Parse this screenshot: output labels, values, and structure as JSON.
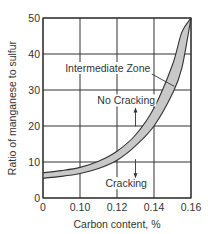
{
  "chart_data": {
    "type": "area",
    "title": "",
    "xlabel": "Carbon content, %",
    "ylabel": "Ratio of manganese to sulfur",
    "x_tick_labels": [
      "0",
      "0.10",
      "0.12",
      "0.14",
      "0.16"
    ],
    "x_tick_values": [
      0.08,
      0.1,
      0.12,
      0.14,
      0.16
    ],
    "y_tick_labels": [
      "0",
      "10",
      "20",
      "30",
      "40",
      "50"
    ],
    "y_tick_values": [
      0,
      10,
      20,
      30,
      40,
      50
    ],
    "xlim": [
      0.08,
      0.16
    ],
    "ylim": [
      0,
      50
    ],
    "grid": true,
    "x_axis_break_note": "first tick labeled 0; axis effectively starts at 0.08",
    "series": [
      {
        "name": "Upper boundary (No Cracking above)",
        "x": [
          0.08,
          0.09,
          0.1,
          0.11,
          0.12,
          0.13,
          0.14,
          0.15,
          0.155,
          0.16
        ],
        "y": [
          7,
          7.6,
          8.5,
          10.2,
          13,
          17.5,
          25,
          37,
          46,
          50
        ]
      },
      {
        "name": "Lower boundary (Cracking below)",
        "x": [
          0.08,
          0.09,
          0.1,
          0.11,
          0.12,
          0.13,
          0.14,
          0.15,
          0.155,
          0.16
        ],
        "y": [
          5.5,
          6,
          6.8,
          8.2,
          10.5,
          14.5,
          20,
          29,
          36,
          50
        ]
      }
    ],
    "annotations": [
      {
        "text": "Intermediate Zone",
        "x": 0.115,
        "y": 35,
        "leader_to": {
          "x": 0.151,
          "y": 31
        }
      },
      {
        "text": "No Cracking",
        "x": 0.125,
        "y": 26,
        "arrow": "up",
        "arrow_x": 0.13
      },
      {
        "text": "Cracking",
        "x": 0.125,
        "y": 3,
        "arrow": "down",
        "arrow_x": 0.13
      }
    ],
    "fill_color": "#c8c8c8",
    "line_color": "#333333"
  }
}
